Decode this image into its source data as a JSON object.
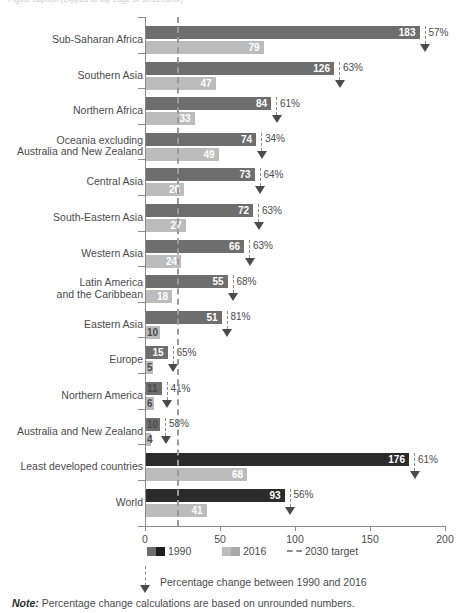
{
  "top_caption": "Figure caption (clipped at top edge of screenshot)",
  "chart_data": {
    "type": "bar",
    "orientation": "horizontal",
    "title": "",
    "xlabel": "",
    "ylabel": "",
    "xlim": [
      0,
      200
    ],
    "xticks": [
      0,
      50,
      100,
      150,
      200
    ],
    "xticklabels": [
      "0",
      "50",
      "100",
      "150",
      "200"
    ],
    "grid": false,
    "legend_position": "bottom",
    "target_line": {
      "label": "2030 target",
      "value": 21
    },
    "categories": [
      "Sub-Saharan Africa",
      "Southern Asia",
      "Northern Africa",
      "Oceania excluding Australia and New Zealand",
      "Central Asia",
      "South-Eastern Asia",
      "Western Asia",
      "Latin America and the Caribbean",
      "Eastern Asia",
      "Europe",
      "Northern America",
      "Australia and New Zealand",
      "Least developed countries",
      "World"
    ],
    "series": [
      {
        "name": "1990",
        "values": [
          183,
          126,
          84,
          74,
          73,
          72,
          66,
          55,
          51,
          15,
          11,
          10,
          176,
          93
        ]
      },
      {
        "name": "2016",
        "values": [
          79,
          47,
          33,
          49,
          26,
          27,
          24,
          18,
          10,
          5,
          6,
          4,
          68,
          41
        ]
      }
    ],
    "annotations": {
      "name": "Percentage change between 1990 and 2016",
      "values": [
        "57%",
        "63%",
        "61%",
        "34%",
        "64%",
        "63%",
        "63%",
        "68%",
        "81%",
        "65%",
        "41%",
        "58%",
        "61%",
        "56%"
      ]
    }
  },
  "rows": [
    {
      "label_line1": "Sub-Saharan Africa",
      "label_line2": "",
      "v1990": 183,
      "v2016": 79,
      "pct": "57%",
      "highlight": false
    },
    {
      "label_line1": "Southern Asia",
      "label_line2": "",
      "v1990": 126,
      "v2016": 47,
      "pct": "63%",
      "highlight": false
    },
    {
      "label_line1": "Northern Africa",
      "label_line2": "",
      "v1990": 84,
      "v2016": 33,
      "pct": "61%",
      "highlight": false
    },
    {
      "label_line1": "Oceania excluding",
      "label_line2": "Australia and New Zealand",
      "v1990": 74,
      "v2016": 49,
      "pct": "34%",
      "highlight": false
    },
    {
      "label_line1": "Central Asia",
      "label_line2": "",
      "v1990": 73,
      "v2016": 26,
      "pct": "64%",
      "highlight": false
    },
    {
      "label_line1": "South-Eastern Asia",
      "label_line2": "",
      "v1990": 72,
      "v2016": 27,
      "pct": "63%",
      "highlight": false
    },
    {
      "label_line1": "Western Asia",
      "label_line2": "",
      "v1990": 66,
      "v2016": 24,
      "pct": "63%",
      "highlight": false
    },
    {
      "label_line1": "Latin America",
      "label_line2": "and the Caribbean",
      "v1990": 55,
      "v2016": 18,
      "pct": "68%",
      "highlight": false
    },
    {
      "label_line1": "Eastern Asia",
      "label_line2": "",
      "v1990": 51,
      "v2016": 10,
      "pct": "81%",
      "highlight": false
    },
    {
      "label_line1": "Europe",
      "label_line2": "",
      "v1990": 15,
      "v2016": 5,
      "pct": "65%",
      "highlight": false
    },
    {
      "label_line1": "Northern America",
      "label_line2": "",
      "v1990": 11,
      "v2016": 6,
      "pct": "41%",
      "highlight": false
    },
    {
      "label_line1": "Australia and New Zealand",
      "label_line2": "",
      "v1990": 10,
      "v2016": 4,
      "pct": "58%",
      "highlight": false
    },
    {
      "label_line1": "Least developed countries",
      "label_line2": "",
      "v1990": 176,
      "v2016": 68,
      "pct": "61%",
      "highlight": true
    },
    {
      "label_line1": "World",
      "label_line2": "",
      "v1990": 93,
      "v2016": 41,
      "pct": "56%",
      "highlight": true
    }
  ],
  "axis": {
    "ticklabels": [
      "0",
      "50",
      "100",
      "150",
      "200"
    ]
  },
  "legend": {
    "item_1990": "1990",
    "item_2016": "2016",
    "item_target": "2030 target"
  },
  "key": {
    "arrow_text": "Percentage change between 1990 and 2016"
  },
  "note": {
    "prefix": "Note:",
    "text": " Percentage change calculations are based on unrounded numbers."
  },
  "colors": {
    "bar_1990": "#6e6e6e",
    "bar_1990_highlight": "#2b2b2b",
    "bar_2016": "#bcbcbc",
    "axis": "#8a8a8a",
    "text": "#4b4b4b"
  }
}
